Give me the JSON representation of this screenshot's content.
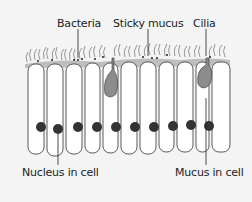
{
  "diagram": {
    "type": "biology-illustration",
    "labels": {
      "bacteria": "Bacteria",
      "sticky_mucus": "Sticky mucus",
      "cilia": "Cilia",
      "nucleus": "Nucleus in cell",
      "mucus_in_cell": "Mucus in cell"
    },
    "colors": {
      "background": "#f4f4f4",
      "outline": "#333333",
      "cell_fill": "#ffffff",
      "mucus": "#8c8c8c",
      "mucus_layer": "#9a9a9a",
      "nucleus": "#333333",
      "cilia": "#555555"
    },
    "cell_count": 12
  }
}
